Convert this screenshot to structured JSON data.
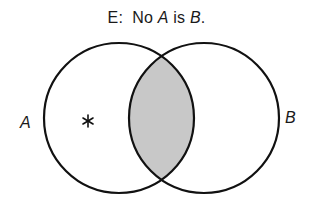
{
  "title": {
    "prefix": "E:  No ",
    "term_a": "A",
    "middle": " is ",
    "term_b": "B",
    "suffix": "."
  },
  "diagram": {
    "type": "venn",
    "circles": [
      {
        "id": "A",
        "label": "A",
        "cx": 119,
        "cy": 118,
        "r": 75
      },
      {
        "id": "B",
        "label": "B",
        "cx": 204,
        "cy": 118,
        "r": 75
      }
    ],
    "shaded_region": "A∩B",
    "shade_color": "#c8c8c8",
    "stroke_color": "#111111",
    "marker": {
      "symbol": "*",
      "region": "A only",
      "x": 88,
      "y": 121
    }
  },
  "labels": {
    "left": "A",
    "right": "B",
    "asterisk": "*"
  }
}
